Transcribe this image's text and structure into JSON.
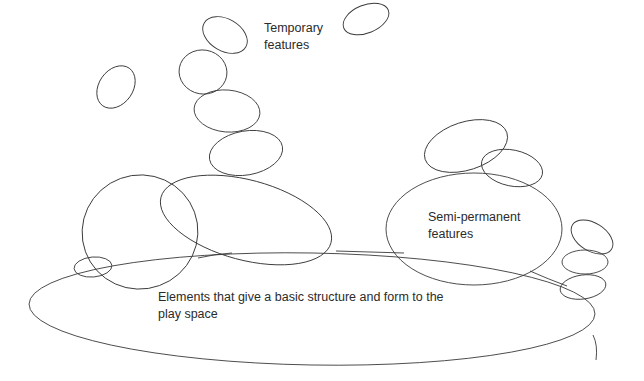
{
  "diagram": {
    "labels": {
      "temporary": "Temporary\nfeatures",
      "semi_permanent": "Semi-permanent\nfeatures",
      "base": "Elements that give a basic structure and form to the\nplay space"
    },
    "stroke_color": "#3a3a3a",
    "background": "#ffffff",
    "layers": [
      {
        "name": "base-structure",
        "shape_count": 1
      },
      {
        "name": "semi-permanent-features",
        "shape_count": 9
      },
      {
        "name": "temporary-features",
        "shape_count": 6
      }
    ]
  }
}
